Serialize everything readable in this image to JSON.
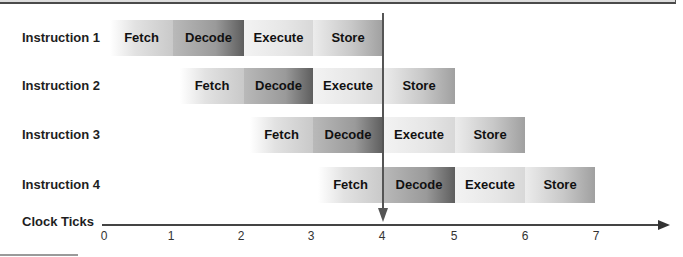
{
  "diagram": {
    "axis": {
      "label": "Clock Ticks",
      "ticks": [
        "0",
        "1",
        "2",
        "3",
        "4",
        "5",
        "6",
        "7"
      ]
    },
    "stages": [
      "Fetch",
      "Decode",
      "Execute",
      "Store"
    ],
    "current_tick_marker": "4",
    "instructions": [
      {
        "label": "Instruction 1",
        "start_tick": 0,
        "stages": [
          "Fetch",
          "Decode",
          "Execute",
          "Store"
        ]
      },
      {
        "label": "Instruction 2",
        "start_tick": 1,
        "stages": [
          "Fetch",
          "Decode",
          "Execute",
          "Store"
        ]
      },
      {
        "label": "Instruction 3",
        "start_tick": 2,
        "stages": [
          "Fetch",
          "Decode",
          "Execute",
          "Store"
        ]
      },
      {
        "label": "Instruction 4",
        "start_tick": 3,
        "stages": [
          "Fetch",
          "Decode",
          "Execute",
          "Store"
        ]
      }
    ]
  }
}
